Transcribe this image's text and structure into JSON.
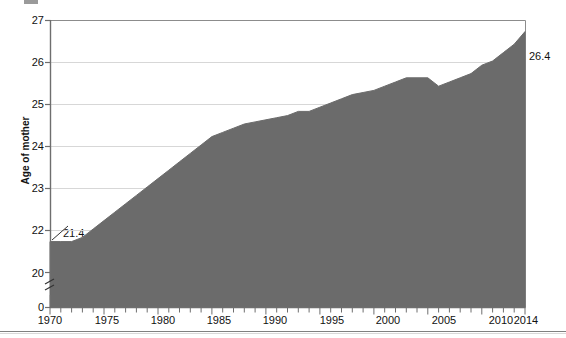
{
  "chart_data": {
    "type": "area",
    "title": "",
    "xlabel": "",
    "ylabel": "Age of mother",
    "xlim": [
      1970,
      2014
    ],
    "ylim": [
      20,
      27
    ],
    "y_axis_broken": true,
    "y_break_base_label": "0",
    "grid": true,
    "legend": "none",
    "series_name": "Age of mother",
    "fill_color": "#6b6b6b",
    "x": [
      1970,
      1971,
      1972,
      1973,
      1974,
      1975,
      1976,
      1977,
      1978,
      1979,
      1980,
      1981,
      1982,
      1983,
      1984,
      1985,
      1986,
      1987,
      1988,
      1989,
      1990,
      1991,
      1992,
      1993,
      1994,
      1995,
      1996,
      1997,
      1998,
      1999,
      2000,
      2001,
      2002,
      2003,
      2004,
      2005,
      2006,
      2007,
      2008,
      2009,
      2010,
      2011,
      2012,
      2013,
      2014
    ],
    "values": [
      21.4,
      21.4,
      21.4,
      21.5,
      21.7,
      21.9,
      22.1,
      22.3,
      22.5,
      22.7,
      22.9,
      23.1,
      23.3,
      23.5,
      23.7,
      23.9,
      24.0,
      24.1,
      24.2,
      24.25,
      24.3,
      24.35,
      24.4,
      24.5,
      24.5,
      24.6,
      24.7,
      24.8,
      24.9,
      24.95,
      25.0,
      25.1,
      25.2,
      25.3,
      25.3,
      25.3,
      25.1,
      25.2,
      25.3,
      25.4,
      25.6,
      25.7,
      25.9,
      26.1,
      26.4
    ],
    "yticks": [
      {
        "value": 27,
        "label": "27"
      },
      {
        "value": 26,
        "label": "26"
      },
      {
        "value": 25,
        "label": "25"
      },
      {
        "value": 24,
        "label": "24"
      },
      {
        "value": 23,
        "label": "23"
      },
      {
        "value": 22,
        "label": "22"
      },
      {
        "value": 20,
        "label": "20"
      },
      {
        "value": 0,
        "label": "0"
      }
    ],
    "xticks_labeled": [
      {
        "value": 1970,
        "label": "1970"
      },
      {
        "value": 1975,
        "label": "1975"
      },
      {
        "value": 1980,
        "label": "1980"
      },
      {
        "value": 1985,
        "label": "1985"
      },
      {
        "value": 1990,
        "label": "1990"
      },
      {
        "value": 1995,
        "label": "1995"
      },
      {
        "value": 2000,
        "label": "2000"
      },
      {
        "value": 2005,
        "label": "2005"
      },
      {
        "value": 2010,
        "label": "2010"
      },
      {
        "value": 2014,
        "label": "2014"
      }
    ],
    "annotations": [
      {
        "name": "start-value",
        "text": "21.4",
        "x": 1970,
        "y": 21.4
      },
      {
        "name": "end-value",
        "text": "26.4",
        "x": 2014,
        "y": 26.4
      }
    ]
  }
}
